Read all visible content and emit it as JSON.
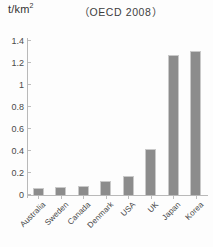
{
  "chart_data": {
    "type": "bar",
    "title": "（OECD 2008）",
    "xlabel": "",
    "ylabel": "t/km2",
    "ylabel_display": "t/km",
    "ylabel_superscript": "2",
    "ylim": [
      0,
      1.4
    ],
    "ytick_values": [
      0,
      0.2,
      0.4,
      0.6,
      0.8,
      1,
      1.2,
      1.4
    ],
    "ytick_labels": [
      "0",
      "0.2",
      "0.4",
      "0.6",
      "0.8",
      "1",
      "1.2",
      "1.4"
    ],
    "categories": [
      "Australia",
      "Sweden",
      "Canada",
      "Denmark",
      "USA",
      "UK",
      "Japan",
      "Korea"
    ],
    "values": [
      0.06,
      0.07,
      0.08,
      0.13,
      0.17,
      0.42,
      1.27,
      1.31
    ],
    "grid": false,
    "legend": false,
    "bar_color": "#8c8c8c",
    "axis_color": "#b9b9b9",
    "text_color": "#454545"
  }
}
